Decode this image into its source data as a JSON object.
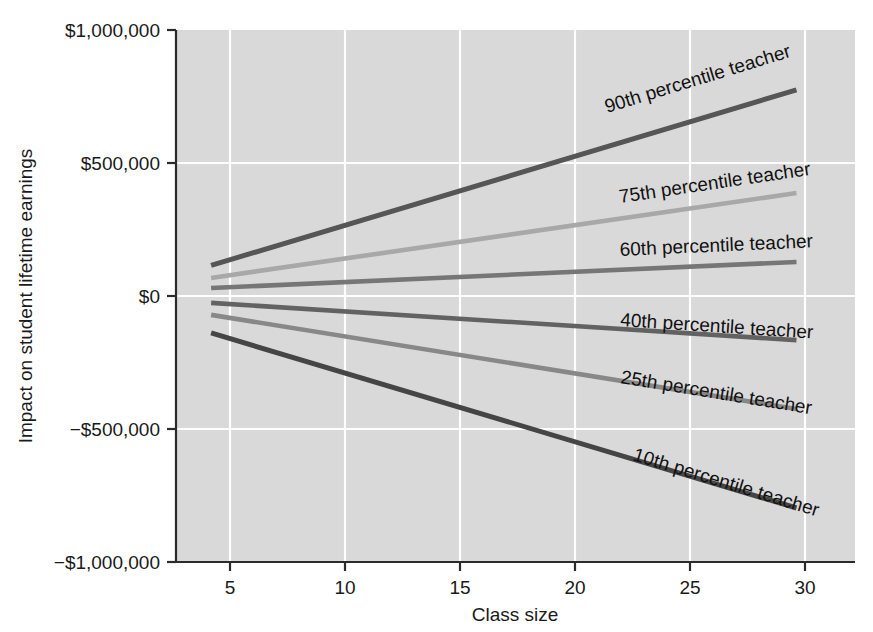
{
  "chart_data": {
    "type": "line",
    "title": "",
    "xlabel": "Class size",
    "ylabel": "Impact on student lifetime earnings",
    "xlim": [
      3.5,
      32.5
    ],
    "ylim": [
      -1000000,
      1000000
    ],
    "xticks": [
      5,
      10,
      15,
      20,
      25,
      30
    ],
    "xticklabels": [
      "5",
      "10",
      "15",
      "20",
      "25",
      "30"
    ],
    "yticks": [
      -1000000,
      -500000,
      0,
      500000,
      1000000
    ],
    "yticklabels": [
      "−$1,000,000",
      "−$500,000",
      "$0",
      "$500,000",
      "$1,000,000"
    ],
    "grid": true,
    "grid_color": "#ffffff",
    "plot_background": "#d9d9d9",
    "figure_background": "#ffffff",
    "legend_position": "inline-labels",
    "x": [
      5,
      30
    ],
    "series": [
      {
        "name": "90th percentile teacher",
        "label": "90th percentile teacher",
        "values": [
          115000,
          775000
        ],
        "color": "#565656",
        "width": 5.0
      },
      {
        "name": "75th percentile teacher",
        "label": "75th percentile teacher",
        "values": [
          68000,
          387000
        ],
        "color": "#a8a8a8",
        "width": 4.6
      },
      {
        "name": "60th percentile teacher",
        "label": "60th percentile teacher",
        "values": [
          30000,
          128000
        ],
        "color": "#767676",
        "width": 4.6
      },
      {
        "name": "40th percentile teacher",
        "label": "40th percentile teacher",
        "values": [
          -26000,
          -166000
        ],
        "color": "#626262",
        "width": 4.6
      },
      {
        "name": "25th percentile teacher",
        "label": "25th percentile teacher",
        "values": [
          -71000,
          -425000
        ],
        "color": "#888888",
        "width": 4.6
      },
      {
        "name": "10th percentile teacher",
        "label": "10th percentile teacher",
        "values": [
          -139000,
          -797000
        ],
        "color": "#454545",
        "width": 5.0
      }
    ]
  },
  "axes": {
    "x_title": "Class size",
    "y_title": "Impact on student lifetime earnings",
    "x_tick_labels": [
      "5",
      "10",
      "15",
      "20",
      "25",
      "30"
    ],
    "y_tick_labels": [
      "$1,000,000",
      "$500,000",
      "$0",
      "−$500,000",
      "−$1,000,000"
    ]
  },
  "series_labels": {
    "p90": "90th percentile teacher",
    "p75": "75th percentile teacher",
    "p60": "60th percentile teacher",
    "p40": "40th percentile teacher",
    "p25": "25th percentile teacher",
    "p10": "10th percentile teacher"
  }
}
